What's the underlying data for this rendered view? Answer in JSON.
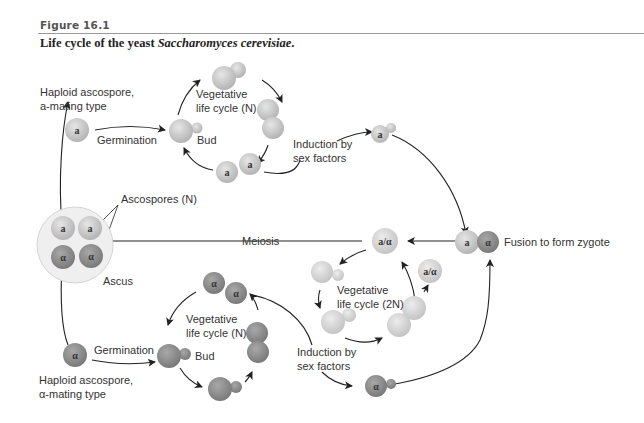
{
  "figure": {
    "label": "Figure 16.1",
    "caption_prefix": "Life cycle of the yeast ",
    "caption_species": "Saccharomyces cerevisiae",
    "caption_suffix": "."
  },
  "labels": {
    "haploid_a_line1": "Haploid ascospore,",
    "haploid_a_line2": "a-mating type",
    "germination_top": "Germination",
    "bud_top": "Bud",
    "veg_n_top_line1": "Vegetative",
    "veg_n_top_line2": "life cycle (N)",
    "induction_top_line1": "Induction by",
    "induction_top_line2": "sex factors",
    "ascospores": "Ascospores (N)",
    "ascus": "Ascus",
    "meiosis": "Meiosis",
    "fusion": "Fusion to form zygote",
    "veg_2n_line1": "Vegetative",
    "veg_2n_line2": "life cycle (2N)",
    "germination_bottom": "Germination",
    "bud_bottom": "Bud",
    "veg_n_bottom_line1": "Vegetative",
    "veg_n_bottom_line2": "life cycle (N)",
    "induction_bottom_line1": "Induction by",
    "induction_bottom_line2": "sex factors",
    "haploid_alpha_line1": "Haploid ascospore,",
    "haploid_alpha_line2": "α-mating type"
  },
  "cell_symbols": {
    "a": "a",
    "alpha": "α",
    "diploid": "a/α"
  },
  "colors": {
    "a_cell": "#c8c8c8",
    "alpha_cell": "#8e8e8e",
    "diploid_cell": "#d2d2d2",
    "ascus": "#ececec",
    "arrow": "#222222"
  }
}
